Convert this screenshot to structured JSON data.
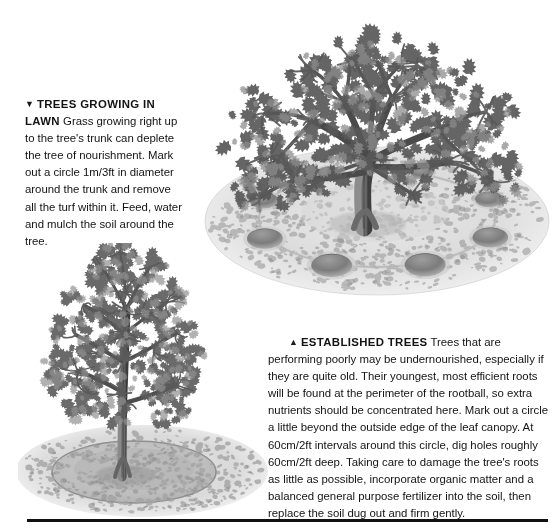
{
  "page": {
    "background_color": "#ffffff",
    "text_color": "#131313",
    "width": 558,
    "height": 532
  },
  "sections": {
    "lawn": {
      "marker_icon": "triangle-down-icon",
      "marker_glyph": "▼",
      "heading": "TREES GROWING IN LAWN",
      "body": " Grass growing right up to the tree's trunk can deplete the tree of nourishment. Mark out a circle 1m/3ft in diameter around the trunk and remove all the turf within it. Feed, water and mulch the soil around the tree."
    },
    "established": {
      "marker_icon": "triangle-up-icon",
      "marker_glyph": "▲",
      "heading": "ESTABLISHED TREES",
      "body": " Trees that are performing poorly may be undernourished, especially if they are quite old. Their youngest, most efficient roots will be found at the perimeter of the rootball, so extra nutrients should be concentrated here. Mark out a circle a little beyond the outside edge of the leaf canopy. At 60cm/2ft intervals around this circle, dig holes roughly 60cm/2ft deep. Taking care to damage the tree's roots as little as possible, incorporate organic matter and a balanced general purpose fertilizer into the soil, then replace the soil dug out and firm gently."
    }
  },
  "illustrations": {
    "top": {
      "name": "established-tree-with-dug-holes-illustration",
      "description": "Mature spreading tree on a grassy mound with a ring of dug holes around it at the canopy perimeter",
      "hole_count": 8,
      "style": "pencil-engraving-grayscale"
    },
    "bottom": {
      "name": "tree-in-lawn-with-cleared-circle-illustration",
      "description": "Slender upright tree in lawn with a circle of bare soil cleared of turf around its trunk",
      "style": "pencil-engraving-grayscale"
    }
  },
  "divider": {
    "name": "bottom-rule",
    "color": "#111111"
  }
}
